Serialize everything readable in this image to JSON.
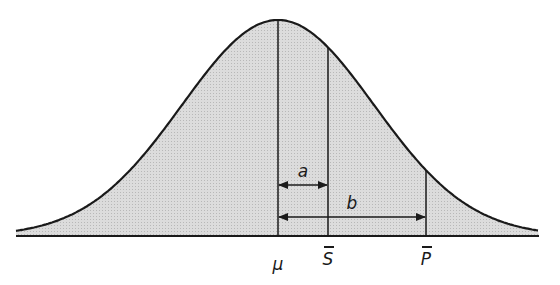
{
  "diagram": {
    "type": "normal-distribution-curve",
    "fill_color": "#d6d6d6",
    "stroke_color": "#1a1a1a",
    "curve": {
      "peak_x": 278,
      "baseline_y": 236,
      "peak_y": 20,
      "sigma_px": 96,
      "x_start": 16,
      "x_end": 539
    },
    "markers": [
      {
        "id": "mu",
        "label": "μ",
        "x": 278,
        "overbar": false
      },
      {
        "id": "s_bar",
        "label": "S",
        "x": 328,
        "overbar": true
      },
      {
        "id": "p_bar",
        "label": "P",
        "x": 426,
        "overbar": true
      }
    ],
    "arrows": [
      {
        "id": "a",
        "label": "a",
        "from": "mu",
        "to": "s_bar",
        "y": 185
      },
      {
        "id": "b",
        "label": "b",
        "from": "mu",
        "to": "p_bar",
        "y": 217
      }
    ]
  }
}
